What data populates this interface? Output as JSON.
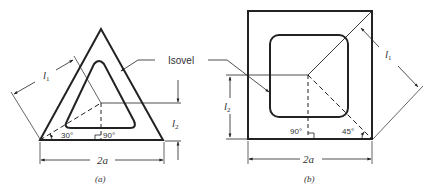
{
  "figure": {
    "panel_a": {
      "caption": "(a)",
      "shape": "equilateral-triangle",
      "labels": {
        "l1": "l",
        "l1_sub": "1",
        "l2": "l",
        "l2_sub": "2",
        "angle_30": "30°",
        "angle_90": "90°",
        "width": "2a"
      }
    },
    "panel_b": {
      "caption": "(b)",
      "shape": "square",
      "labels": {
        "l1": "l",
        "l1_sub": "1",
        "l2": "l",
        "l2_sub": "2",
        "angle_90": "90°",
        "angle_45": "45°",
        "width": "2a"
      }
    },
    "isovel_label": "Isovel",
    "colors": {
      "stroke": "#222222",
      "background": "#ffffff"
    }
  }
}
